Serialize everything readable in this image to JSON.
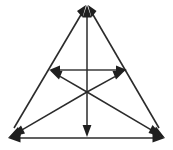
{
  "figure": {
    "background_color": "#ffffff",
    "stroke_color": "#2b2b2b",
    "arrow_fill_color": "#1f1f1f",
    "width": 173,
    "height": 150
  },
  "chart_data": {
    "type": "diagram",
    "subtitle": "",
    "xlabel": "",
    "ylabel": "",
    "grid": false,
    "legend": false,
    "coordinate_space": {
      "x_range": [
        0,
        173
      ],
      "y_range": [
        0,
        150
      ],
      "y_axis_direction": "down"
    },
    "points": [
      {
        "id": "apex",
        "label": "",
        "x": 87,
        "y": 5
      },
      {
        "id": "bottom_left",
        "label": "",
        "x": 8,
        "y": 138
      },
      {
        "id": "bottom_right",
        "label": "",
        "x": 165,
        "y": 138
      },
      {
        "id": "center",
        "label": "",
        "x": 87,
        "y": 92
      },
      {
        "id": "mid_left",
        "label": "",
        "x": 49,
        "y": 70
      },
      {
        "id": "mid_right",
        "label": "",
        "x": 127,
        "y": 70
      },
      {
        "id": "bottom_mid",
        "label": "",
        "x": 87,
        "y": 136
      }
    ],
    "segments": [
      {
        "id": "side_left",
        "from": "bottom_left",
        "to": "apex",
        "arrow": "both",
        "role": "triangle-side"
      },
      {
        "id": "side_right",
        "from": "apex",
        "to": "bottom_right",
        "arrow": "both",
        "role": "triangle-side"
      },
      {
        "id": "side_bottom",
        "from": "bottom_left",
        "to": "bottom_right",
        "arrow": "both",
        "role": "triangle-side"
      },
      {
        "id": "mid_horizontal",
        "from": "mid_left",
        "to": "mid_right",
        "arrow": "both",
        "role": "midline"
      },
      {
        "id": "ray_up",
        "from": "center",
        "to": "apex",
        "arrow": "end",
        "role": "center-ray"
      },
      {
        "id": "ray_down",
        "from": "center",
        "to": "bottom_mid",
        "arrow": "end",
        "role": "center-ray"
      },
      {
        "id": "ray_up_left",
        "from": "center",
        "to": "mid_left",
        "arrow": "end",
        "role": "center-ray"
      },
      {
        "id": "ray_up_right",
        "from": "center",
        "to": "mid_right",
        "arrow": "end",
        "role": "center-ray"
      },
      {
        "id": "ray_down_left",
        "from": "center",
        "to": "bottom_left",
        "arrow": "end",
        "role": "center-ray"
      },
      {
        "id": "ray_down_right",
        "from": "center",
        "to": "bottom_right",
        "arrow": "end",
        "role": "center-ray"
      }
    ],
    "annotations": [],
    "counts": {
      "vertices": 3,
      "segments": 10,
      "arrowheads": 16
    }
  }
}
